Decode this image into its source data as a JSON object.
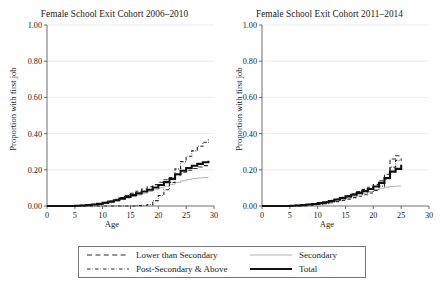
{
  "figure": {
    "ylabel": "Proportion with first job",
    "xlabel": "Age",
    "ytick_labels": [
      "0.00",
      "0.20",
      "0.40",
      "0.60",
      "0.80",
      "1.00"
    ],
    "xtick_labels": [
      "0",
      "5",
      "10",
      "15",
      "20",
      "25",
      "30"
    ],
    "panels": [
      {
        "title": "Female School Exit Cohort 2006–2010"
      },
      {
        "title": "Female School Exit Cohort 2011–2014"
      }
    ]
  },
  "legend": {
    "entries": [
      {
        "label": "Lower than Secondary",
        "style": "dashed",
        "color": "#2b2b2b"
      },
      {
        "label": "Secondary",
        "style": "solid-thin",
        "color": "#b3b3b3"
      },
      {
        "label": "Post-Secondary & Above",
        "style": "dash-dot",
        "color": "#2b2b2b"
      },
      {
        "label": "Total",
        "style": "solid-thick",
        "color": "#111111"
      }
    ]
  },
  "chart_data": {
    "type": "line",
    "xlabel": "Age",
    "ylabel": "Proportion with first job",
    "xlim": [
      0,
      30
    ],
    "ylim": [
      0,
      1.0
    ],
    "xticks": [
      0,
      5,
      10,
      15,
      20,
      25,
      30
    ],
    "yticks": [
      0.0,
      0.2,
      0.4,
      0.6,
      0.8,
      1.0
    ],
    "grid": "horizontal",
    "legend_position": "below-figure",
    "step_type": "post",
    "panels": [
      {
        "title": "Female School Exit Cohort 2006–2010",
        "x": [
          0,
          1,
          2,
          3,
          4,
          5,
          6,
          7,
          8,
          9,
          10,
          11,
          12,
          13,
          14,
          15,
          16,
          17,
          18,
          19,
          20,
          21,
          22,
          23,
          24,
          25,
          26,
          27,
          28,
          29
        ],
        "series": [
          {
            "name": "Lower than Secondary",
            "values": [
              0,
              0,
              0,
              0,
              0,
              0.002,
              0.004,
              0.007,
              0.01,
              0.014,
              0.02,
              0.028,
              0.037,
              0.047,
              0.058,
              0.07,
              0.082,
              0.094,
              0.106,
              0.118,
              0.131,
              0.145,
              0.158,
              0.172,
              0.186,
              0.197,
              0.207,
              0.216,
              0.223,
              0.228
            ]
          },
          {
            "name": "Secondary",
            "values": [
              0,
              0,
              0,
              0,
              0,
              0.001,
              0.002,
              0.004,
              0.007,
              0.01,
              0.014,
              0.02,
              0.027,
              0.035,
              0.043,
              0.052,
              0.061,
              0.07,
              0.08,
              0.09,
              0.1,
              0.11,
              0.12,
              0.13,
              0.139,
              0.146,
              0.151,
              0.155,
              0.158,
              0.16
            ]
          },
          {
            "name": "Post-Secondary & Above",
            "values": [
              0,
              0,
              0,
              0,
              0,
              0,
              0,
              0,
              0,
              0,
              0,
              0,
              0,
              0,
              0,
              0,
              0.002,
              0.004,
              0.008,
              0.03,
              0.058,
              0.09,
              0.13,
              0.205,
              0.245,
              0.275,
              0.305,
              0.33,
              0.352,
              0.368
            ]
          },
          {
            "name": "Total",
            "values": [
              0,
              0,
              0,
              0,
              0,
              0.001,
              0.003,
              0.005,
              0.008,
              0.012,
              0.017,
              0.024,
              0.032,
              0.041,
              0.05,
              0.06,
              0.07,
              0.08,
              0.09,
              0.102,
              0.116,
              0.132,
              0.15,
              0.175,
              0.195,
              0.21,
              0.222,
              0.233,
              0.242,
              0.25
            ]
          }
        ]
      },
      {
        "title": "Female School Exit Cohort 2011–2014",
        "x": [
          0,
          1,
          2,
          3,
          4,
          5,
          6,
          7,
          8,
          9,
          10,
          11,
          12,
          13,
          14,
          15,
          16,
          17,
          18,
          19,
          20,
          21,
          22,
          23,
          24,
          25
        ],
        "series": [
          {
            "name": "Lower than Secondary",
            "values": [
              0,
              0,
              0,
              0,
              0,
              0.002,
              0.004,
              0.006,
              0.009,
              0.013,
              0.018,
              0.024,
              0.031,
              0.039,
              0.048,
              0.058,
              0.068,
              0.08,
              0.092,
              0.104,
              0.118,
              0.14,
              0.175,
              0.26,
              0.278,
              0.28
            ]
          },
          {
            "name": "Secondary",
            "values": [
              0,
              0,
              0,
              0,
              0,
              0.001,
              0.002,
              0.004,
              0.006,
              0.009,
              0.013,
              0.018,
              0.024,
              0.031,
              0.038,
              0.046,
              0.054,
              0.062,
              0.071,
              0.08,
              0.09,
              0.098,
              0.104,
              0.108,
              0.11,
              0.11
            ]
          },
          {
            "name": "Post-Secondary & Above",
            "values": [
              0,
              0,
              0,
              0,
              0,
              0,
              0.001,
              0.002,
              0.004,
              0.006,
              0.009,
              0.013,
              0.018,
              0.024,
              0.031,
              0.038,
              0.046,
              0.054,
              0.062,
              0.072,
              0.086,
              0.11,
              0.15,
              0.215,
              0.252,
              0.262
            ]
          },
          {
            "name": "Total",
            "values": [
              0,
              0,
              0,
              0,
              0,
              0.001,
              0.003,
              0.005,
              0.008,
              0.011,
              0.016,
              0.021,
              0.028,
              0.036,
              0.044,
              0.053,
              0.062,
              0.072,
              0.082,
              0.094,
              0.108,
              0.128,
              0.155,
              0.19,
              0.205,
              0.228
            ]
          }
        ]
      }
    ]
  }
}
